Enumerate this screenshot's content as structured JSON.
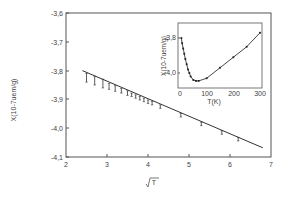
{
  "chart_data": [
    {
      "type": "scatter",
      "title": "",
      "xlabel": "√T",
      "ylabel": "X(10-7uem/g)",
      "xlim": [
        2,
        7
      ],
      "ylim": [
        -4.1,
        -3.6
      ],
      "xticks": [
        "2",
        "3",
        "4",
        "5",
        "6",
        "7"
      ],
      "yticks": [
        "-3,6",
        "-3,7",
        "-3,8",
        "-3,9",
        "-4,0",
        "-4,1"
      ],
      "grid": false,
      "series": [
        {
          "name": "data",
          "x": [
            2.5,
            2.7,
            2.9,
            3.05,
            3.2,
            3.35,
            3.5,
            3.6,
            3.7,
            3.8,
            3.9,
            4.0,
            4.1,
            4.3,
            4.8,
            5.3,
            5.8,
            6.2
          ],
          "y": [
            -3.825,
            -3.835,
            -3.845,
            -3.855,
            -3.862,
            -3.87,
            -3.878,
            -3.884,
            -3.89,
            -3.896,
            -3.902,
            -3.908,
            -3.913,
            -3.925,
            -3.955,
            -3.985,
            -4.015,
            -4.038
          ],
          "error": [
            0.015,
            0.015,
            0.015,
            0.01,
            0.01,
            0.008,
            0.008,
            0.006,
            0.006,
            0.006,
            0.006,
            0.006,
            0.006,
            0.006,
            0.006,
            0.006,
            0.006,
            0.006
          ]
        },
        {
          "name": "linear fit",
          "type": "line",
          "x": [
            2.4,
            6.8
          ],
          "y": [
            -3.8,
            -4.068
          ]
        }
      ]
    },
    {
      "type": "line",
      "title": "inset",
      "xlabel": "T(K)",
      "ylabel": "X(10-7uem/g)",
      "xlim": [
        0,
        300
      ],
      "ylim": [
        -4.06,
        -3.74
      ],
      "xticks": [
        "0",
        "100",
        "200",
        "300"
      ],
      "yticks": [
        "-3,8",
        "-4,0"
      ],
      "grid": false,
      "series": [
        {
          "name": "data",
          "x": [
            5,
            8,
            12,
            16,
            20,
            25,
            30,
            35,
            40,
            50,
            60,
            70,
            100,
            150,
            200,
            250,
            300
          ],
          "y": [
            -3.8,
            -3.83,
            -3.86,
            -3.89,
            -3.92,
            -3.95,
            -3.98,
            -4.0,
            -4.02,
            -4.04,
            -4.045,
            -4.045,
            -4.03,
            -3.97,
            -3.91,
            -3.85,
            -3.77
          ]
        }
      ]
    }
  ],
  "main": {
    "ylabel": "X(10-7uem/g)",
    "xlabel": "√T",
    "yticks": [
      "-3,6",
      "-3,7",
      "-3,8",
      "-3,9",
      "-4,0",
      "-4,1"
    ],
    "xticks": [
      "2",
      "3",
      "4",
      "5",
      "6",
      "7"
    ]
  },
  "inset": {
    "ylabel": "X(10-7uem/g)",
    "xlabel": "T(K)",
    "yticks": [
      "-3,8",
      "-4,0"
    ],
    "xticks": [
      "0",
      "100",
      "200",
      "300"
    ]
  }
}
